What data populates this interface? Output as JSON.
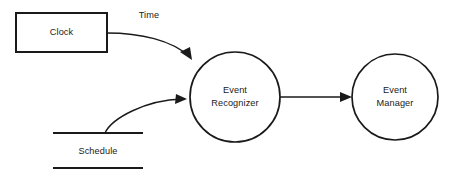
{
  "diagram": {
    "type": "data-flow-diagram",
    "width": 465,
    "height": 184,
    "background_color": "#ffffff",
    "stroke_color": "#1a1a1a",
    "text_color": "#1a1a1a"
  },
  "nodes": {
    "clock": {
      "label": "Clock",
      "kind": "external-entity",
      "shape": "rectangle",
      "x": 16,
      "y": 13,
      "width": 91,
      "height": 39,
      "center_x": 61.5,
      "center_y": 32.5
    },
    "event_recognizer": {
      "label_line1": "Event",
      "label_line2": "Recognizer",
      "kind": "process",
      "shape": "circle",
      "center_x": 235,
      "center_y": 97,
      "radius": 45
    },
    "event_manager": {
      "label_line1": "Event",
      "label_line2": "Manager",
      "kind": "process",
      "shape": "circle",
      "center_x": 395,
      "center_y": 97,
      "radius": 43
    },
    "schedule": {
      "label": "Schedule",
      "kind": "data-store",
      "shape": "open-rectangle",
      "line_x_start": 53,
      "line_x_end": 143,
      "top_line_y": 133,
      "bottom_line_y": 168,
      "label_x": 98,
      "label_y": 152
    }
  },
  "flows": {
    "time": {
      "label": "Time",
      "label_x": 149,
      "label_y": 16,
      "from": "clock",
      "to": "event_recognizer",
      "path": "M 107 33 C 140 33, 172 40, 190 57",
      "arrow_points": "190,59 182,49 191,48"
    },
    "schedule_flow": {
      "label": "",
      "from": "schedule",
      "to": "event_recognizer",
      "path": "M 105 133 C 112 119, 145 100, 183 99",
      "arrow_points": "186,99 175,104 175,94"
    },
    "recognizer_to_manager": {
      "label": "",
      "from": "event_recognizer",
      "to": "event_manager",
      "path": "M 280 97 L 347 97",
      "arrow_points": "352,97 341,102 341,92"
    }
  }
}
